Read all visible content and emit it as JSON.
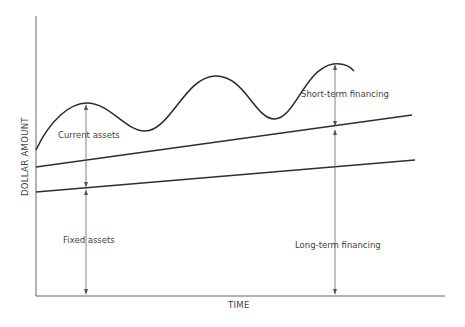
{
  "diagram": {
    "x_axis_label": "TIME",
    "y_axis_label": "DOLLAR AMOUNT",
    "labels": {
      "current_assets": "Current assets",
      "fixed_assets": "Fixed assets",
      "short_term_financing": "Short-term financing",
      "long_term_financing": "Long-term financing"
    },
    "colors": {
      "line": "#2e2e2e",
      "axis": "#555555",
      "arrow": "#555555",
      "text": "#444444",
      "background": "#ffffff"
    }
  }
}
